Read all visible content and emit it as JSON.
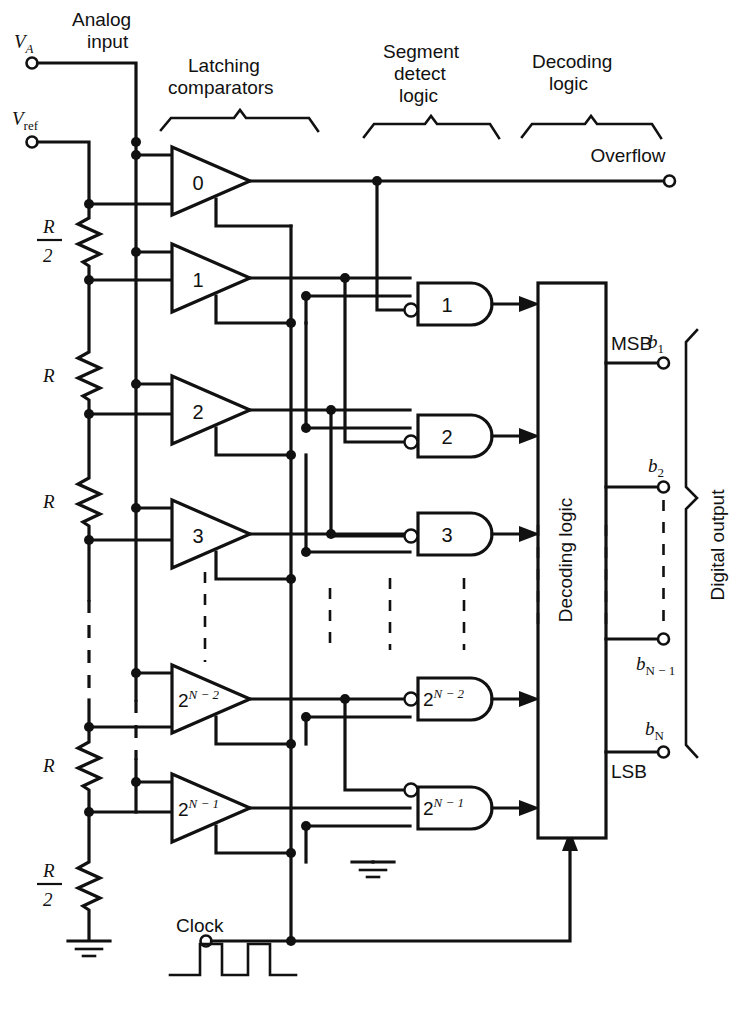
{
  "diagram": {
    "type": "circuit-schematic"
  },
  "terminals": {
    "va": "V",
    "va_sub": "A",
    "analog_input": "Analog\ninput",
    "analog_input_line1": "Analog",
    "analog_input_line2": "input",
    "vref": "V",
    "vref_sub": "ref",
    "overflow": "Overflow",
    "clock": "Clock"
  },
  "braces": [
    {
      "id": "latching-comparators",
      "line1": "Latching",
      "line2": "comparators"
    },
    {
      "id": "segment-detect-logic",
      "line1": "Segment",
      "line2": "detect",
      "line3": "logic"
    },
    {
      "id": "decoding-logic",
      "line1": "Decoding",
      "line2": "logic"
    },
    {
      "id": "digital-output",
      "label": "Digital output"
    }
  ],
  "resistors": [
    {
      "id": "r-top",
      "num": "R",
      "den": "2",
      "fraction": true
    },
    {
      "id": "r-1",
      "num": "R",
      "fraction": false
    },
    {
      "id": "r-2",
      "num": "R",
      "fraction": false
    },
    {
      "id": "r-3",
      "num": "R",
      "fraction": false
    },
    {
      "id": "r-bottom",
      "num": "R",
      "den": "2",
      "fraction": true
    }
  ],
  "comparators": [
    {
      "id": "comp-0",
      "label": "0",
      "exp": false
    },
    {
      "id": "comp-1",
      "label": "1",
      "exp": false
    },
    {
      "id": "comp-2",
      "label": "2",
      "exp": false
    },
    {
      "id": "comp-3",
      "label": "3",
      "exp": false
    },
    {
      "id": "comp-2n-2",
      "base": "2",
      "exponent": "N − 2",
      "exp": true
    },
    {
      "id": "comp-2n-1",
      "base": "2",
      "exponent": "N − 1",
      "exp": true
    }
  ],
  "and_gates": [
    {
      "id": "gate-1",
      "label": "1",
      "exp": false
    },
    {
      "id": "gate-2",
      "label": "2",
      "exp": false
    },
    {
      "id": "gate-3",
      "label": "3",
      "exp": false
    },
    {
      "id": "gate-2n-2",
      "base": "2",
      "exponent": "N − 2",
      "exp": true
    },
    {
      "id": "gate-2n-1",
      "base": "2",
      "exponent": "N − 1",
      "exp": true
    }
  ],
  "decoder": {
    "label": "Decoding logic"
  },
  "outputs": [
    {
      "id": "b1",
      "bit": "b",
      "sub": "1",
      "tag": "MSB"
    },
    {
      "id": "b2",
      "bit": "b",
      "sub": "2",
      "tag": ""
    },
    {
      "id": "bn-1",
      "bit": "b",
      "sub": "N − 1",
      "tag": ""
    },
    {
      "id": "bn",
      "bit": "b",
      "sub": "N",
      "tag": "LSB"
    }
  ],
  "colors": {
    "ink": "#111111",
    "paper": "#ffffff"
  }
}
